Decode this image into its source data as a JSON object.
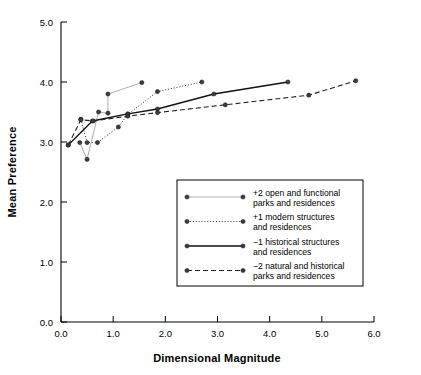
{
  "chart_data": {
    "type": "line",
    "title": "",
    "xlabel": "Dimensional Magnitude",
    "ylabel": "Mean Preference",
    "xlim": [
      0.0,
      6.0
    ],
    "ylim": [
      0.0,
      5.0
    ],
    "xticks": [
      "0.0",
      "1.0",
      "2.0",
      "3.0",
      "4.0",
      "5.0",
      "6.0"
    ],
    "yticks": [
      "0.0",
      "1.0",
      "2.0",
      "3.0",
      "4.0",
      "5.0"
    ],
    "xtick_values": [
      0.0,
      1.0,
      2.0,
      3.0,
      4.0,
      5.0,
      6.0
    ],
    "ytick_values": [
      0.0,
      1.0,
      2.0,
      3.0,
      4.0,
      5.0
    ],
    "grid": false,
    "legend_position": "center",
    "series": [
      {
        "name": "+2 open and functional parks and residences",
        "legend_label_line1": "+2 open and functional",
        "legend_label_line2": "parks and residences",
        "style": "solid",
        "color": "#999999",
        "width": 0.8,
        "points": [
          {
            "x": 0.36,
            "y": 2.99
          },
          {
            "x": 0.5,
            "y": 2.71
          },
          {
            "x": 0.72,
            "y": 3.5
          },
          {
            "x": 0.9,
            "y": 3.48
          },
          {
            "x": 0.9,
            "y": 3.8
          },
          {
            "x": 1.55,
            "y": 3.99
          }
        ]
      },
      {
        "name": "+1 modern structures and residences",
        "legend_label_line1": "+1 modern structures",
        "legend_label_line2": "and residences",
        "style": "dotted",
        "color": "#333333",
        "width": 1.0,
        "points": [
          {
            "x": 0.38,
            "y": 3.38
          },
          {
            "x": 0.5,
            "y": 2.99
          },
          {
            "x": 0.7,
            "y": 2.99
          },
          {
            "x": 1.1,
            "y": 3.25
          },
          {
            "x": 1.28,
            "y": 3.46
          },
          {
            "x": 1.85,
            "y": 3.84
          },
          {
            "x": 2.7,
            "y": 4.0
          }
        ]
      },
      {
        "name": "-1 historical structures and residences",
        "legend_label_line1": "−1 historical structures",
        "legend_label_line2": "and residences",
        "style": "solid",
        "color": "#111111",
        "width": 1.3,
        "points": [
          {
            "x": 0.14,
            "y": 2.95
          },
          {
            "x": 0.6,
            "y": 3.35
          },
          {
            "x": 1.28,
            "y": 3.47
          },
          {
            "x": 1.85,
            "y": 3.55
          },
          {
            "x": 2.93,
            "y": 3.8
          },
          {
            "x": 4.35,
            "y": 4.0
          }
        ]
      },
      {
        "name": "-2 natural and historical parks and residences",
        "legend_label_line1": "−2 natural and historical",
        "legend_label_line2": "parks and residences",
        "style": "dashed",
        "color": "#222222",
        "width": 1.1,
        "points": [
          {
            "x": 0.14,
            "y": 2.95
          },
          {
            "x": 0.38,
            "y": 3.37
          },
          {
            "x": 0.62,
            "y": 3.35
          },
          {
            "x": 1.28,
            "y": 3.43
          },
          {
            "x": 1.85,
            "y": 3.49
          },
          {
            "x": 3.15,
            "y": 3.62
          },
          {
            "x": 4.75,
            "y": 3.78
          },
          {
            "x": 5.65,
            "y": 4.02
          }
        ]
      }
    ],
    "legend_entries": [
      {
        "line1": "+2 open and functional",
        "line2": "parks and residences"
      },
      {
        "line1": "+1 modern structures",
        "line2": "and residences"
      },
      {
        "line1": "−1 historical structures",
        "line2": "and residences"
      },
      {
        "line1": "−2 natural and historical",
        "line2": "parks and residences"
      }
    ]
  }
}
